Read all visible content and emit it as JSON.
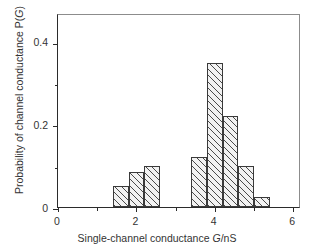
{
  "chart_data": {
    "type": "bar",
    "title": "",
    "subtitle": "",
    "xlabel": "Single-channel conductance G/nS",
    "ylabel": "Probability of channel conductance P(G)",
    "xlim": [
      0,
      6.2
    ],
    "ylim": [
      0,
      0.47
    ],
    "grid": false,
    "legend": null,
    "bin_width": 0.4,
    "x_ticks": [
      {
        "value": 0,
        "label": "0",
        "type": "major"
      },
      {
        "value": 1,
        "label": "",
        "type": "minor"
      },
      {
        "value": 2,
        "label": "2",
        "type": "major"
      },
      {
        "value": 3,
        "label": "",
        "type": "minor"
      },
      {
        "value": 4,
        "label": "4",
        "type": "major"
      },
      {
        "value": 5,
        "label": "",
        "type": "minor"
      },
      {
        "value": 6,
        "label": "6",
        "type": "major"
      }
    ],
    "y_ticks": [
      {
        "value": 0,
        "label": "0",
        "type": "major"
      },
      {
        "value": 0.1,
        "label": "",
        "type": "minor"
      },
      {
        "value": 0.2,
        "label": "0.2",
        "type": "major"
      },
      {
        "value": 0.3,
        "label": "",
        "type": "minor"
      },
      {
        "value": 0.4,
        "label": "0.4",
        "type": "major"
      }
    ],
    "bars": [
      {
        "x_start": 1.4,
        "x_end": 1.8,
        "value": 0.05
      },
      {
        "x_start": 1.8,
        "x_end": 2.2,
        "value": 0.085
      },
      {
        "x_start": 2.2,
        "x_end": 2.6,
        "value": 0.1
      },
      {
        "x_start": 3.4,
        "x_end": 3.8,
        "value": 0.12
      },
      {
        "x_start": 3.8,
        "x_end": 4.2,
        "value": 0.35
      },
      {
        "x_start": 4.2,
        "x_end": 4.6,
        "value": 0.22
      },
      {
        "x_start": 4.6,
        "x_end": 5.0,
        "value": 0.1
      },
      {
        "x_start": 5.0,
        "x_end": 5.4,
        "value": 0.025
      }
    ],
    "categories": [
      "1.4-1.8",
      "1.8-2.2",
      "2.2-2.6",
      "3.4-3.8",
      "3.8-4.2",
      "4.2-4.6",
      "4.6-5.0",
      "5.0-5.4"
    ],
    "values": [
      0.05,
      0.085,
      0.1,
      0.12,
      0.35,
      0.22,
      0.1,
      0.025
    ],
    "style": {
      "bar_fill": "#f2f2f2",
      "bar_hatch": "diagonal-45",
      "bar_edge": "#3a3a3a",
      "axis_color": "#2b2b2b",
      "background": "#ffffff"
    }
  },
  "axis_titles": {
    "x_prefix": "Single-channel conductance ",
    "x_symbol": "G",
    "x_suffix": "/nS",
    "y_prefix": "Probability of channel conductance P(",
    "y_symbol": "G",
    "y_suffix": ")"
  }
}
